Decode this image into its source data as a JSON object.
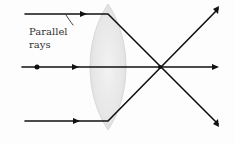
{
  "diagram": {
    "label_line1": "Parallel",
    "label_line2": "rays",
    "colors": {
      "ray": "#111111",
      "lens_fill": "#e6e6e6",
      "lens_edge": "#cfcfcf",
      "background": "#fdfdfd"
    },
    "elements": {
      "lens": "biconvex lens",
      "rays": [
        "top parallel ray",
        "center axis ray",
        "bottom parallel ray"
      ],
      "focal_point": "rays converge at focal point then diverge"
    }
  }
}
